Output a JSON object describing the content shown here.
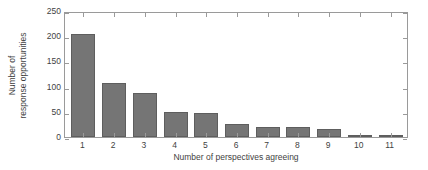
{
  "chart_data": {
    "type": "bar",
    "title": "",
    "subtitle": "",
    "xlabel": "Number of perspectives agreeing",
    "ylabel_line1": "Number of",
    "ylabel_line2": "response opportunities",
    "ylabel": "Number of response opportunities",
    "categories": [
      "1",
      "2",
      "3",
      "4",
      "5",
      "6",
      "7",
      "8",
      "9",
      "10",
      "11"
    ],
    "values": [
      205,
      107,
      87,
      49,
      47,
      26,
      20,
      20,
      16,
      3,
      3
    ],
    "ylim": [
      0,
      250
    ],
    "yticks": [
      0,
      50,
      100,
      150,
      200,
      250
    ],
    "ytick_labels": [
      "0",
      "50",
      "100",
      "150",
      "200",
      "250"
    ],
    "xlim": [
      0.4,
      11.6
    ],
    "grid": false,
    "legend": null,
    "legend_position": "none",
    "bar_color": "#757575",
    "bar_edge_color": "#5e5e5e",
    "axis_color": "#9a9a9a",
    "text_color": "#3f3f3f",
    "background_color": "#ffffff"
  }
}
